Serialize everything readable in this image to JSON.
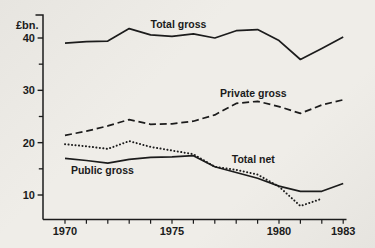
{
  "figure": {
    "background_color": "#edebe6",
    "ink_color": "#1c1c1c"
  },
  "chart_data": {
    "type": "line",
    "title": "",
    "xlabel": "",
    "ylabel": "£bn.",
    "grid": false,
    "legend_position": "inline-labels",
    "ylim": [
      5,
      44
    ],
    "xlim": [
      1970,
      1983
    ],
    "y_major_ticks": [
      10,
      20,
      30,
      40
    ],
    "y_minor_ticks": [
      15,
      25,
      35
    ],
    "x_tick_years": [
      1970,
      1971,
      1972,
      1973,
      1974,
      1975,
      1976,
      1977,
      1978,
      1979,
      1980,
      1981,
      1982,
      1983
    ],
    "x_tick_labels": [
      "1970",
      "1975",
      "1980",
      "1983"
    ],
    "x": [
      1970,
      1971,
      1972,
      1973,
      1974,
      1975,
      1976,
      1977,
      1978,
      1979,
      1980,
      1981,
      1982,
      1983
    ],
    "series": [
      {
        "name": "Total gross",
        "style": "solid",
        "values": [
          39.0,
          39.3,
          39.4,
          41.8,
          40.6,
          40.3,
          40.8,
          40.0,
          41.4,
          41.6,
          39.5,
          35.9,
          38.0,
          40.2
        ],
        "label_pos": {
          "x": 1975.3,
          "y": 42.5
        }
      },
      {
        "name": "Private gross",
        "style": "dashed",
        "values": [
          21.4,
          22.2,
          23.2,
          24.4,
          23.5,
          23.6,
          24.1,
          25.3,
          27.5,
          27.9,
          26.9,
          25.6,
          27.2,
          28.2
        ],
        "label_pos": {
          "x": 1978.8,
          "y": 29.3
        }
      },
      {
        "name": "Total net",
        "style": "dotted",
        "values": [
          19.7,
          19.3,
          18.8,
          20.3,
          19.2,
          18.5,
          17.8,
          15.4,
          14.8,
          13.9,
          11.6,
          7.9,
          9.3,
          null
        ],
        "label_pos": {
          "x": 1978.8,
          "y": 16.8
        }
      },
      {
        "name": "Public gross",
        "style": "solid",
        "values": [
          17.0,
          16.6,
          16.1,
          16.8,
          17.2,
          17.3,
          17.5,
          15.4,
          14.3,
          13.2,
          11.7,
          10.7,
          10.7,
          12.2
        ],
        "label_pos": {
          "x": 1971.75,
          "y": 14.7
        }
      }
    ]
  }
}
